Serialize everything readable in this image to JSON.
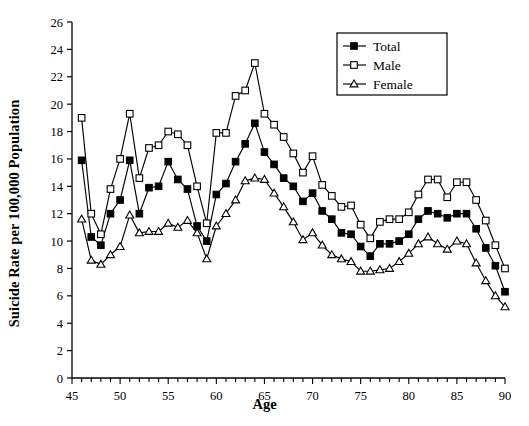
{
  "chart_data": {
    "type": "line",
    "title": "",
    "xlabel": "Age",
    "ylabel": "Suicide Rate per 100,000 Population",
    "xlim": [
      45,
      90
    ],
    "ylim": [
      0,
      26
    ],
    "xticks": [
      45,
      50,
      55,
      60,
      65,
      70,
      75,
      80,
      85,
      90
    ],
    "yticks": [
      0,
      2,
      4,
      6,
      8,
      10,
      12,
      14,
      16,
      18,
      20,
      22,
      24,
      26
    ],
    "xtick_labels": [
      "45",
      "50",
      "55",
      "60",
      "65",
      "70",
      "75",
      "80",
      "85",
      "90"
    ],
    "ytick_labels": [
      "0",
      "2",
      "4",
      "6",
      "8",
      "10",
      "12",
      "14",
      "16",
      "18",
      "20",
      "22",
      "24",
      "26"
    ],
    "x_minor_tick_interval": 1,
    "grid": false,
    "legend_position": "top-right",
    "x": [
      46,
      47,
      48,
      49,
      50,
      51,
      52,
      53,
      54,
      55,
      56,
      57,
      58,
      59,
      60,
      61,
      62,
      63,
      64,
      65,
      66,
      67,
      68,
      69,
      70,
      71,
      72,
      73,
      74,
      75,
      76,
      77,
      78,
      79,
      80,
      81,
      82,
      83,
      84,
      85,
      86,
      87,
      88,
      89,
      90
    ],
    "series": [
      {
        "name": "Total",
        "marker": "filled-square",
        "color": "#000000",
        "values": [
          15.9,
          10.3,
          9.7,
          12.0,
          13.0,
          15.9,
          12.0,
          13.9,
          14.0,
          15.8,
          14.5,
          13.8,
          11.1,
          10.0,
          13.4,
          14.2,
          15.8,
          17.1,
          18.6,
          16.5,
          15.6,
          14.6,
          14.0,
          12.9,
          13.5,
          12.2,
          11.6,
          10.6,
          10.5,
          9.6,
          8.9,
          9.8,
          9.8,
          10.0,
          10.5,
          11.6,
          12.2,
          12.0,
          11.7,
          12.0,
          12.0,
          10.9,
          9.5,
          8.2,
          6.3
        ]
      },
      {
        "name": "Male",
        "marker": "open-square",
        "color": "#000000",
        "values": [
          19.0,
          12.0,
          10.5,
          13.8,
          16.0,
          19.3,
          14.6,
          16.8,
          17.0,
          18.0,
          17.8,
          17.0,
          14.0,
          11.3,
          17.9,
          17.9,
          20.6,
          21.0,
          23.0,
          19.3,
          18.5,
          17.6,
          16.4,
          15.0,
          16.2,
          14.1,
          13.3,
          12.5,
          12.6,
          11.2,
          10.2,
          11.4,
          11.6,
          11.6,
          12.1,
          13.4,
          14.5,
          14.5,
          13.2,
          14.3,
          14.3,
          13.0,
          11.5,
          9.7,
          8.0
        ]
      },
      {
        "name": "Female",
        "marker": "open-triangle",
        "color": "#000000",
        "values": [
          11.6,
          8.6,
          8.3,
          9.0,
          9.6,
          11.9,
          10.6,
          10.7,
          10.7,
          11.3,
          11.0,
          11.5,
          10.6,
          8.7,
          11.1,
          12.0,
          13.0,
          14.4,
          14.6,
          14.5,
          13.5,
          12.5,
          11.4,
          10.1,
          10.6,
          9.7,
          9.0,
          8.7,
          8.5,
          7.8,
          7.8,
          7.9,
          8.0,
          8.5,
          9.1,
          9.8,
          10.3,
          9.8,
          9.4,
          10.0,
          9.8,
          8.4,
          7.1,
          6.0,
          5.2
        ]
      }
    ]
  },
  "legend": {
    "entries": [
      {
        "label": "Total",
        "marker": "filled-square"
      },
      {
        "label": "Male",
        "marker": "open-square"
      },
      {
        "label": "Female",
        "marker": "open-triangle"
      }
    ]
  }
}
